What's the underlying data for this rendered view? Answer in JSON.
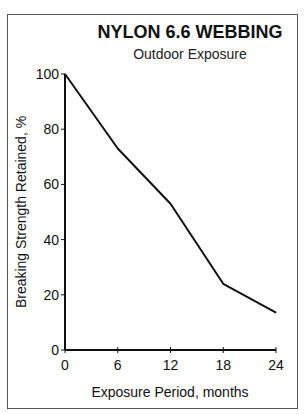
{
  "chart_data": {
    "type": "line",
    "title": "NYLON 6.6 WEBBING",
    "subtitle": "Outdoor Exposure",
    "xlabel": "Exposure Period, months",
    "ylabel": "Breaking Strength Retained, %",
    "x": [
      0,
      6,
      12,
      18,
      24
    ],
    "series": [
      {
        "name": "Nylon 6.6 webbing",
        "values": [
          100,
          73,
          53,
          24,
          13.5
        ]
      }
    ],
    "xlim": [
      0,
      24
    ],
    "ylim": [
      0,
      100
    ],
    "xticks": [
      "0",
      "6",
      "12",
      "18",
      "24"
    ],
    "yticks": [
      "0",
      "20",
      "40",
      "60",
      "80",
      "100"
    ],
    "grid": false,
    "legend": "none",
    "colors": {
      "line": "#111111",
      "axis": "#111111"
    }
  }
}
